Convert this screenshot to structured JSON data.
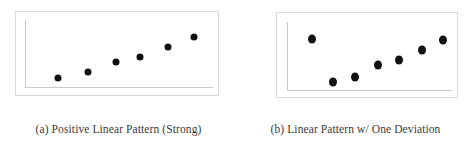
{
  "figure": {
    "background_color": "#ffffff",
    "frame_color": "#d9d9d9",
    "axis_color": "#c9c9c9",
    "dot_color": "#111111",
    "caption_color": "#3a3a3a"
  },
  "panels": [
    {
      "key": "a",
      "caption": "(a)  Positive Linear Pattern (Strong)"
    },
    {
      "key": "b",
      "caption": "(b) Linear Pattern w/ One Deviation"
    }
  ],
  "chart_data": [
    {
      "type": "scatter",
      "title": "(a)  Positive Linear Pattern (Strong)",
      "xlabel": "",
      "ylabel": "",
      "xlim": [
        0,
        100
      ],
      "ylim": [
        0,
        100
      ],
      "grid": false,
      "legend": null,
      "axes_shown": [
        "y-left",
        "x-bottom"
      ],
      "n_points": 6,
      "series": [
        {
          "name": "observations",
          "color": "#111111",
          "x": [
            17,
            33,
            48,
            61,
            76,
            90
          ],
          "y": [
            12,
            22,
            38,
            46,
            63,
            79
          ]
        }
      ],
      "annotations": []
    },
    {
      "type": "scatter",
      "title": "(b) Linear Pattern w/ One Deviation",
      "xlabel": "",
      "ylabel": "",
      "xlim": [
        0,
        100
      ],
      "ylim": [
        0,
        100
      ],
      "grid": false,
      "legend": null,
      "axes_shown": [
        "y-left",
        "x-bottom"
      ],
      "n_points": 7,
      "series": [
        {
          "name": "observations",
          "color": "#111111",
          "x": [
            14,
            27,
            41,
            55,
            68,
            82,
            95
          ],
          "y": [
            80,
            10,
            18,
            38,
            46,
            62,
            79
          ]
        }
      ],
      "annotations": [
        {
          "text": "deviation point",
          "x": 14,
          "y": 80
        }
      ]
    }
  ]
}
